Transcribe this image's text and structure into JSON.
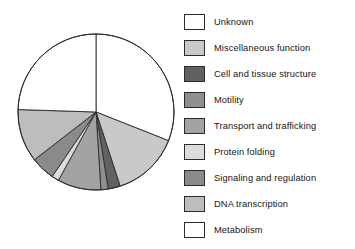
{
  "figure": {
    "title": "",
    "background_color": "#ffffff",
    "outline_color": "#2b2b2b"
  },
  "chart_data": {
    "type": "pie",
    "title": "",
    "xlabel": "",
    "ylabel": "",
    "legend_position": "right",
    "grid": false,
    "start_angle_deg": 0,
    "direction": "clockwise",
    "categories": [
      "Unknown",
      "Miscellaneous function",
      "Cell and tissue structure",
      "Motility",
      "Transport and trafficking",
      "Protein folding",
      "Signaling and regulation",
      "DNA transcription",
      "Metabolism"
    ],
    "values": [
      31.0,
      14.0,
      2.5,
      1.5,
      9.0,
      1.5,
      5.0,
      11.0,
      24.5
    ],
    "colors": [
      "#ffffff",
      "#c9c9c9",
      "#616161",
      "#8f8f8f",
      "#a3a3a3",
      "#dcdcdc",
      "#8a8a8a",
      "#bdbdbd",
      "#ffffff"
    ],
    "slice_edge_color": "#2b2b2b",
    "units": "percent"
  },
  "legend": {
    "items": [
      {
        "label": "Unknown",
        "color": "#ffffff",
        "swatch_name": "swatch-unknown"
      },
      {
        "label": "Miscellaneous function",
        "color": "#c9c9c9",
        "swatch_name": "swatch-miscellaneous-function"
      },
      {
        "label": "Cell and tissue structure",
        "color": "#616161",
        "swatch_name": "swatch-cell-and-tissue-structure"
      },
      {
        "label": "Motility",
        "color": "#8f8f8f",
        "swatch_name": "swatch-motility"
      },
      {
        "label": "Transport and trafficking",
        "color": "#a3a3a3",
        "swatch_name": "swatch-transport-and-trafficking"
      },
      {
        "label": "Protein folding",
        "color": "#dcdcdc",
        "swatch_name": "swatch-protein-folding"
      },
      {
        "label": "Signaling and regulation",
        "color": "#8a8a8a",
        "swatch_name": "swatch-signaling-and-regulation"
      },
      {
        "label": "DNA transcription",
        "color": "#bdbdbd",
        "swatch_name": "swatch-dna-transcription"
      },
      {
        "label": "Metabolism",
        "color": "#ffffff",
        "swatch_name": "swatch-metabolism"
      }
    ]
  }
}
